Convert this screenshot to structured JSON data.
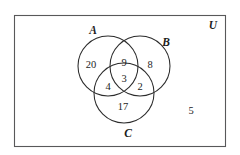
{
  "figure": {
    "type": "venn-diagram-3-set",
    "title": "",
    "universe_label": "U",
    "background_color": "#ffffff",
    "border_color": "#58585a",
    "circle_color": "#2b2b2b",
    "text_color": "#1d1d1d"
  },
  "sets": [
    {
      "id": "A",
      "label": "A",
      "label_x": 93,
      "label_y": 34,
      "cx": 108,
      "cy": 66,
      "r": 30
    },
    {
      "id": "B",
      "label": "B",
      "label_x": 166,
      "label_y": 46,
      "cx": 140,
      "cy": 66,
      "r": 30
    },
    {
      "id": "C",
      "label": "C",
      "label_x": 128,
      "label_y": 137,
      "cx": 124,
      "cy": 93,
      "r": 30
    }
  ],
  "regions": [
    {
      "id": "A-only",
      "description": "A only",
      "value": "20",
      "x": 91,
      "y": 68
    },
    {
      "id": "AB-only",
      "description": "A and B only",
      "value": "9",
      "x": 124,
      "y": 66
    },
    {
      "id": "B-only",
      "description": "B only",
      "value": "8",
      "x": 150,
      "y": 68
    },
    {
      "id": "ABC",
      "description": "A and B and C",
      "value": "3",
      "x": 124,
      "y": 82
    },
    {
      "id": "AC-only",
      "description": "A and C only",
      "value": "4",
      "x": 108,
      "y": 90
    },
    {
      "id": "BC-only",
      "description": "B and C only",
      "value": "2",
      "x": 140,
      "y": 90
    },
    {
      "id": "C-only",
      "description": "C only",
      "value": "17",
      "x": 123,
      "y": 110
    },
    {
      "id": "outside",
      "description": "Outside A, B and C",
      "value": "5",
      "x": 191,
      "y": 114
    }
  ],
  "universe": {
    "label_x": 213,
    "label_y": 29,
    "rect": {
      "x": 14,
      "y": 15,
      "width": 212,
      "height": 132
    }
  },
  "chart_data": {
    "type": "venn",
    "title": "",
    "sets": [
      "A",
      "B",
      "C"
    ],
    "universe_label": "U",
    "region_values": {
      "A_only": 20,
      "B_only": 8,
      "C_only": 17,
      "A_and_B_only": 9,
      "A_and_C_only": 4,
      "B_and_C_only": 2,
      "A_and_B_and_C": 3,
      "outside_all": 5
    },
    "set_totals": {
      "A": 36,
      "B": 22,
      "C": 26
    },
    "universe_total": 68
  }
}
